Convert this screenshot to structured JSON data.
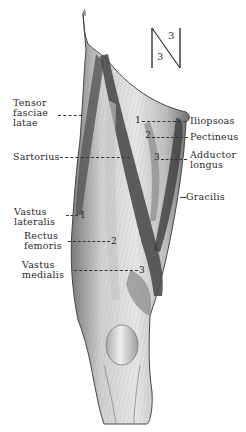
{
  "figure": {
    "orientation_marker": {
      "top_number": "3",
      "bottom_number": "3"
    },
    "labels_left": [
      {
        "text_lines": [
          "Tensor",
          "fasciae",
          "latae"
        ]
      },
      {
        "text_lines": [
          "Sartorius"
        ]
      },
      {
        "text_lines": [
          "Vastus",
          "lateralis"
        ],
        "number": "1"
      },
      {
        "text_lines": [
          "Rectus",
          "femoris"
        ],
        "number": "2"
      },
      {
        "text_lines": [
          "Vastus",
          "medialis"
        ],
        "number": "3"
      }
    ],
    "labels_right": [
      {
        "text_lines": [
          "Iliopsoas"
        ],
        "number": "1"
      },
      {
        "text_lines": [
          "Pectineus"
        ],
        "number": "2"
      },
      {
        "text_lines": [
          "Adductor",
          "longus"
        ],
        "number": "3"
      },
      {
        "text_lines": [
          "Gracilis"
        ]
      }
    ],
    "colors": {
      "ink": "#2a2a2a",
      "muscle_light": "#d9d9d9",
      "muscle_mid": "#9a9a9a",
      "muscle_dark": "#555555",
      "background": "#ffffff"
    }
  }
}
